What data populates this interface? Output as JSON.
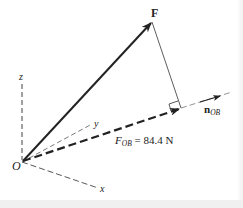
{
  "diagram": {
    "type": "vector-projection",
    "labels": {
      "force": "F",
      "origin": "O",
      "axis_x": "x",
      "axis_y": "y",
      "axis_z": "z",
      "unit_vector_main": "n",
      "unit_vector_sub": "OB",
      "projection_main": "F",
      "projection_sub": "OB",
      "projection_value": " = 84.4 N"
    },
    "projection": {
      "symbol": "F_OB",
      "magnitude": 84.4,
      "unit": "N"
    },
    "colors": {
      "ink": "#222222",
      "thin_line": "#555555",
      "background": "#ffffff"
    }
  }
}
